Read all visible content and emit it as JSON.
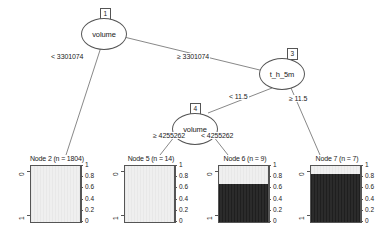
{
  "plot": {
    "type": "decision-tree",
    "inner_nodes": [
      {
        "id": "1",
        "label": "volume"
      },
      {
        "id": "3",
        "label": "t_h_5m"
      },
      {
        "id": "4",
        "label": "volume"
      }
    ],
    "edge_labels": {
      "n1_left": "< 3301074",
      "n1_right": "≥ 3301074",
      "n3_left": "< 11.5",
      "n3_right": "≥ 11.5",
      "n4_left": "≥ 4255262",
      "n4_right": "< 4255262"
    }
  },
  "chart_data": {
    "type": "bar",
    "title": "",
    "xlabel": "",
    "ylabel": "",
    "ylim": [
      0,
      1
    ],
    "yticks": [
      "1",
      "0.8",
      "0.6",
      "0.4",
      "0.2",
      "0"
    ],
    "categories": [
      "0",
      "1"
    ],
    "grid": false,
    "legend": "none",
    "panels": [
      {
        "name": "Node 2 (n = 1804)",
        "node_id": 2,
        "n": 1804,
        "values": [
          1.0,
          0.0
        ],
        "dark_fraction": 0.0,
        "light_fraction": 1.0
      },
      {
        "name": "Node 5 (n = 14)",
        "node_id": 5,
        "n": 14,
        "values": [
          1.0,
          0.0
        ],
        "dark_fraction": 0.0,
        "light_fraction": 1.0
      },
      {
        "name": "Node 6 (n = 9)",
        "node_id": 6,
        "n": 9,
        "values": [
          0.33,
          0.67
        ],
        "dark_fraction": 0.67,
        "light_fraction": 0.33
      },
      {
        "name": "Node 7 (n = 7)",
        "node_id": 7,
        "n": 7,
        "values": [
          0.14,
          0.86
        ],
        "dark_fraction": 0.86,
        "light_fraction": 0.14
      }
    ],
    "colors": {
      "light_fill": "#ededed",
      "dark_fill": "#262626",
      "outline": "#555555"
    }
  }
}
